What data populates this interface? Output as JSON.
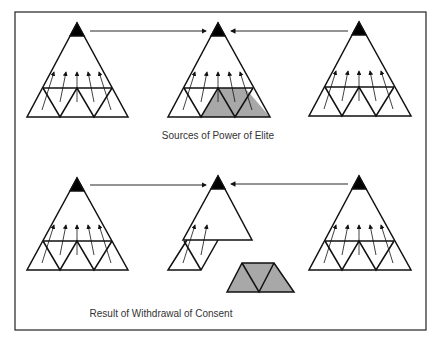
{
  "captions": {
    "top": "Sources of Power of Elite",
    "bottom": "Result of Withdrawal of Consent"
  },
  "colors": {
    "line": "#111111",
    "apex": "#000000",
    "shaded": "#a8a8a8"
  }
}
